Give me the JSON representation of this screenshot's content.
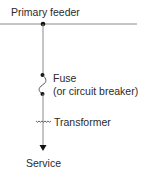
{
  "diagram": {
    "labels": {
      "primary_feeder": "Primary feeder",
      "fuse_line1": "Fuse",
      "fuse_line2": "(or circuit breaker)",
      "transformer": "Transformer",
      "service": "Service"
    },
    "colors": {
      "line": "#8a8a8a",
      "node": "#111111",
      "text": "#2a2a2a"
    }
  }
}
